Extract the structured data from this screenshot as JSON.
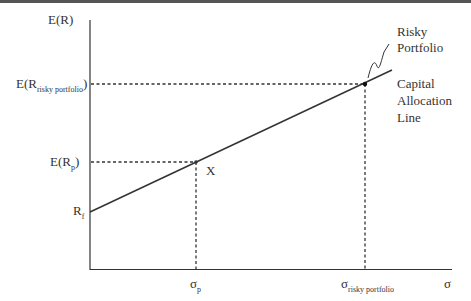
{
  "y_axis_label": "E(R)",
  "x_axis_label": "σ",
  "labels": {
    "er_risky": {
      "main": "E(R",
      "sub": "risky portfolio",
      "close": ")"
    },
    "er_p": {
      "main": "E(R",
      "sub": "p",
      "close": ")"
    },
    "rf": {
      "main": "R",
      "sub": "f"
    },
    "sigma_p": {
      "main": "σ",
      "sub": "p"
    },
    "sigma_risky": {
      "main": "σ",
      "sub": "risky portfolio"
    },
    "point_x": "X",
    "risky_portfolio": [
      "Risky",
      "Portfolio"
    ],
    "cal": [
      "Capital",
      "Allocation",
      "Line"
    ]
  },
  "colors": {
    "line": "#333333",
    "topbar": "#555555"
  }
}
